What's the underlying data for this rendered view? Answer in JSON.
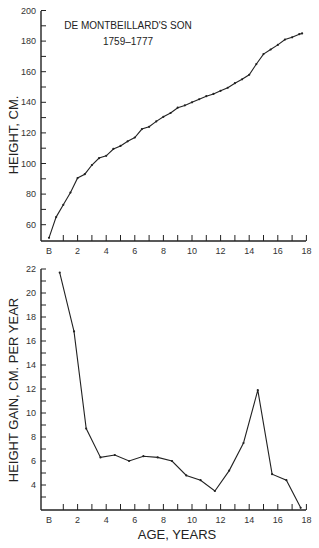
{
  "chart_data": [
    {
      "type": "line",
      "title": "DE MONTBEILLARD'S SON",
      "subtitle": "1759–1777",
      "xlabel": "",
      "ylabel": "HEIGHT, CM.",
      "xlim": [
        0,
        18
      ],
      "ylim": [
        50,
        200
      ],
      "x_ticks": [
        "B",
        "2",
        "4",
        "6",
        "8",
        "10",
        "12",
        "14",
        "16",
        "18"
      ],
      "y_ticks": [
        60,
        80,
        100,
        120,
        140,
        160,
        180,
        200
      ],
      "grid": false,
      "series": [
        {
          "name": "Height",
          "x": [
            0,
            0.5,
            1.0,
            1.5,
            2.0,
            2.5,
            3.0,
            3.5,
            4.0,
            4.5,
            5.0,
            5.5,
            6.0,
            6.5,
            7.0,
            7.5,
            8.0,
            8.5,
            9.0,
            9.5,
            10.0,
            10.5,
            11.0,
            11.5,
            12.0,
            12.5,
            13.0,
            13.5,
            14.0,
            14.5,
            15.0,
            15.5,
            16.0,
            16.5,
            17.0,
            17.5,
            17.7
          ],
          "values": [
            51.4,
            65,
            73,
            81,
            90.5,
            93,
            99,
            103.5,
            105,
            109.5,
            111.5,
            114.5,
            117,
            122.5,
            124,
            127.5,
            130.5,
            133,
            136.5,
            138,
            140,
            142,
            144,
            145.5,
            147.5,
            149.5,
            152.5,
            155,
            158,
            165,
            171.5,
            174.5,
            177.5,
            181,
            182.5,
            184.5,
            185
          ]
        }
      ]
    },
    {
      "type": "line",
      "title": "",
      "xlabel": "AGE, YEARS",
      "ylabel": "HEIGHT GAIN, CM. PER YEAR",
      "xlim": [
        0,
        18
      ],
      "ylim": [
        2,
        22
      ],
      "x_ticks": [
        "B",
        "2",
        "4",
        "6",
        "8",
        "10",
        "12",
        "14",
        "16",
        "18"
      ],
      "y_ticks": [
        4,
        6,
        8,
        10,
        12,
        14,
        16,
        18,
        20,
        22
      ],
      "grid": false,
      "series": [
        {
          "name": "Height gain",
          "x": [
            0.75,
            1.75,
            2.6,
            3.6,
            4.6,
            5.6,
            6.6,
            7.6,
            8.6,
            9.6,
            10.6,
            11.6,
            12.6,
            13.6,
            14.6,
            15.6,
            16.6,
            17.6
          ],
          "values": [
            21.7,
            16.8,
            8.7,
            6.3,
            6.5,
            6.0,
            6.4,
            6.3,
            6.0,
            4.8,
            4.4,
            3.5,
            5.2,
            7.5,
            11.9,
            4.9,
            4.4,
            2.1
          ]
        }
      ]
    }
  ],
  "labels": {
    "title": "DE MONTBEILLARD'S SON",
    "subtitle": "1759–1777",
    "top_ylabel": "HEIGHT, CM.",
    "bottom_ylabel": "HEIGHT GAIN, CM. PER YEAR",
    "xlabel": "AGE, YEARS"
  }
}
